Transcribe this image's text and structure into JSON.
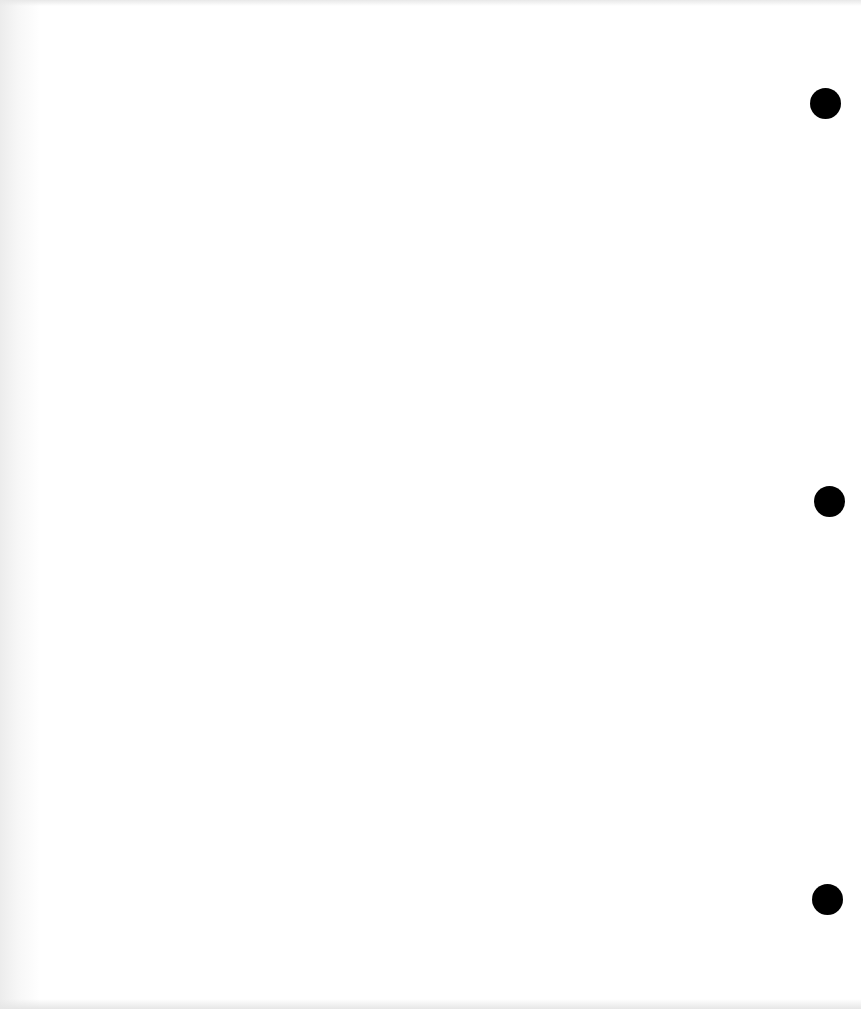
{
  "page": {
    "background": "#ffffff",
    "hole_punches": [
      {
        "x": 810,
        "y": 88,
        "d": 31
      },
      {
        "x": 814,
        "y": 486,
        "d": 31
      },
      {
        "x": 812,
        "y": 884,
        "d": 31
      }
    ],
    "hole_color": "#000000"
  }
}
